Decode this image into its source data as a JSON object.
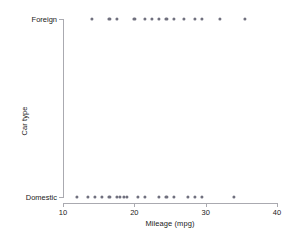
{
  "chart_data": {
    "type": "scatter",
    "title": "",
    "xlabel": "Mileage (mpg)",
    "ylabel": "Car type",
    "xlim": [
      9,
      43
    ],
    "xticks": [
      10,
      20,
      30,
      40
    ],
    "xtick_labels": [
      "10",
      "20",
      "30",
      "40"
    ],
    "ycategories": [
      "Domestic",
      "Foreign"
    ],
    "ytick_labels": [
      "Foreign",
      "Domestic"
    ],
    "grid": false,
    "legend": "none",
    "marker_color": "#70707e",
    "axis_color": "#aaaab0",
    "background_color": "#ffffff",
    "series": [
      {
        "name": "Foreign",
        "y_category": "Foreign",
        "values": [
          14,
          16.5,
          17.5,
          20,
          21.5,
          22.5,
          23.5,
          24.5,
          25.5,
          27,
          28.5,
          29.5,
          32,
          35.5
        ]
      },
      {
        "name": "Domestic",
        "y_category": "Domestic",
        "values": [
          12,
          13.5,
          14.5,
          15.5,
          16.5,
          17.5,
          18,
          18.5,
          19,
          20.5,
          21.5,
          23.5,
          24.5,
          25.5,
          27.5,
          28.5,
          29.5,
          34
        ]
      }
    ]
  },
  "axes": {
    "x_title": "Mileage (mpg)",
    "y_title": "Car type",
    "x_ticks": [
      {
        "label": "10",
        "value": 10
      },
      {
        "label": "20",
        "value": 20
      },
      {
        "label": "30",
        "value": 30
      },
      {
        "label": "40",
        "value": 40
      }
    ],
    "y_ticks": [
      {
        "label": "Foreign",
        "value": 1
      },
      {
        "label": "Domestic",
        "value": 0
      }
    ]
  }
}
